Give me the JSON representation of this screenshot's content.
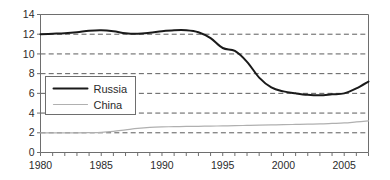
{
  "chart_data": {
    "type": "line",
    "title": "",
    "subtitle": "",
    "xlabel": "",
    "ylabel": "",
    "xlim": [
      1980,
      2007
    ],
    "ylim": [
      0,
      14
    ],
    "grid": true,
    "grid_axis": "y",
    "legend_position": "inside-left-center",
    "y_ticks": [
      0,
      2,
      4,
      6,
      8,
      10,
      12,
      14
    ],
    "y_tick_labels": [
      "0",
      "2",
      "4",
      "6",
      "8",
      "10",
      "12",
      "14"
    ],
    "x_ticks": [
      1980,
      1981,
      1982,
      1983,
      1984,
      1985,
      1986,
      1987,
      1988,
      1989,
      1990,
      1991,
      1992,
      1993,
      1994,
      1995,
      1996,
      1997,
      1998,
      1999,
      2000,
      2001,
      2002,
      2003,
      2004,
      2005,
      2006,
      2007
    ],
    "x_tick_labels_shown": [
      "1980",
      "1985",
      "1990",
      "1995",
      "2000",
      "2005"
    ],
    "x_tick_labels_shown_at": [
      1980,
      1985,
      1990,
      1995,
      2000,
      2005
    ],
    "x": [
      1980,
      1981,
      1982,
      1983,
      1984,
      1985,
      1986,
      1987,
      1988,
      1989,
      1990,
      1991,
      1992,
      1993,
      1994,
      1995,
      1996,
      1997,
      1998,
      1999,
      2000,
      2001,
      2002,
      2003,
      2004,
      2005,
      2006,
      2007
    ],
    "series": [
      {
        "name": "Russia",
        "color": "#1a1a1a",
        "width": 2.0,
        "values": [
          12.0,
          12.05,
          12.1,
          12.2,
          12.35,
          12.4,
          12.3,
          12.1,
          12.05,
          12.15,
          12.3,
          12.4,
          12.4,
          12.2,
          11.6,
          10.6,
          10.3,
          9.2,
          7.6,
          6.6,
          6.2,
          6.0,
          5.85,
          5.8,
          5.9,
          6.0,
          6.5,
          7.2
        ],
        "values_note": "continues to 9.5 at series end"
      },
      {
        "name": "China",
        "color": "#b0b0b0",
        "width": 1.2,
        "values": [
          2.0,
          2.0,
          2.0,
          2.0,
          2.02,
          2.05,
          2.15,
          2.3,
          2.45,
          2.55,
          2.6,
          2.62,
          2.65,
          2.66,
          2.68,
          2.7,
          2.72,
          2.75,
          2.78,
          2.8,
          2.82,
          2.85,
          2.88,
          2.9,
          2.95,
          3.0,
          3.1,
          3.2
        ]
      }
    ],
    "russia_path": [
      [
        1980,
        12.0
      ],
      [
        1981,
        12.05
      ],
      [
        1982,
        12.12
      ],
      [
        1983,
        12.22
      ],
      [
        1984,
        12.34
      ],
      [
        1985,
        12.4
      ],
      [
        1986,
        12.32
      ],
      [
        1987,
        12.14
      ],
      [
        1988,
        12.02
      ],
      [
        1989,
        12.1
      ],
      [
        1990,
        12.32
      ],
      [
        1991,
        12.42
      ],
      [
        1992,
        12.4
      ],
      [
        1993,
        12.16
      ],
      [
        1994,
        11.55
      ],
      [
        1995,
        10.55
      ],
      [
        1996,
        10.25
      ],
      [
        1997,
        9.1
      ],
      [
        1998,
        7.5
      ],
      [
        1999,
        6.55
      ],
      [
        2000,
        6.15
      ],
      [
        2001,
        5.95
      ],
      [
        2002,
        5.85
      ],
      [
        2003,
        5.8
      ],
      [
        2004,
        5.95
      ],
      [
        2005,
        6.6
      ],
      [
        2006,
        7.5
      ],
      [
        2007,
        8.4
      ]
    ],
    "russia_path_note": "visual trace: plateau ~12-12.4 through 1992, sharp decline 1993-1999 to trough ~5.8 (2003 region), recovery to ~9.5 at right edge",
    "annotations": []
  },
  "legend": {
    "entries": [
      {
        "label": "Russia"
      },
      {
        "label": "China"
      }
    ]
  },
  "axes": {
    "y_labels": [
      "14",
      "12",
      "10",
      "8",
      "6",
      "4",
      "2",
      "0"
    ],
    "x_labels": [
      "1980",
      "1985",
      "1990",
      "1995",
      "2000",
      "2005"
    ]
  },
  "colors": {
    "russia_line": "#1a1a1a",
    "china_line": "#b5b5b5",
    "grid": "#4a4a4a",
    "frame": "#6e6e6e",
    "text": "#2b2b2b",
    "background": "#ffffff"
  }
}
